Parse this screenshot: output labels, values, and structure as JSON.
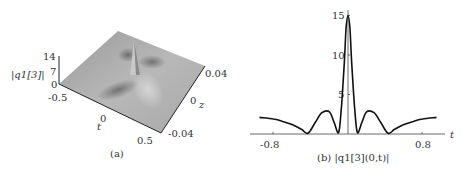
{
  "panels": {
    "a": {
      "caption": "(a)",
      "zlabel": "|q1[3]|",
      "xlabel": "t",
      "ylabel": "z",
      "z_ticks": [
        "0",
        "7",
        "14"
      ],
      "t_ticks": [
        "-0.5",
        "0",
        "0.5"
      ],
      "z_axis_ticks": [
        "-0.04",
        "0",
        "0.04"
      ]
    },
    "b": {
      "caption": "(b) |q1[3](0,t)|",
      "xlabel": "t",
      "x_ticks": [
        "-0.8",
        "0.8"
      ],
      "y_ticks": [
        "5",
        "10",
        "15"
      ]
    }
  },
  "chart_data": [
    {
      "type": "surface",
      "title": "(a)",
      "xlabel": "t",
      "ylabel": "z",
      "zlabel": "|q1[3]|",
      "xlim": [
        -0.5,
        0.5
      ],
      "ylim": [
        -0.04,
        0.04
      ],
      "zlim": [
        0,
        14
      ],
      "x_ticks": [
        -0.5,
        0,
        0.5
      ],
      "y_ticks": [
        -0.04,
        0,
        0.04
      ],
      "z_ticks": [
        0,
        7,
        14
      ],
      "description": "Grey 3D surface of a rogue-wave-like structure: flat background near ~2 with a sharp central peak (~14) at t=0,z=0 flanked by dark troughs along diagonal ridges",
      "peak": {
        "t": 0,
        "z": 0,
        "value": 14
      }
    },
    {
      "type": "line",
      "title": "(b) |q1[3](0,t)|",
      "xlabel": "t",
      "ylabel": "",
      "xlim": [
        -0.95,
        0.95
      ],
      "ylim": [
        0,
        15.5
      ],
      "x_ticks": [
        -0.8,
        0.8
      ],
      "y_ticks": [
        5,
        10,
        15
      ],
      "grid": false,
      "series": [
        {
          "name": "|q1[3](0,t)|",
          "x": [
            -0.95,
            -0.8,
            -0.7,
            -0.6,
            -0.5,
            -0.43,
            -0.35,
            -0.28,
            -0.2,
            -0.15,
            -0.1,
            -0.07,
            -0.04,
            -0.02,
            0,
            0.02,
            0.04,
            0.07,
            0.1,
            0.15,
            0.2,
            0.28,
            0.35,
            0.43,
            0.5,
            0.6,
            0.7,
            0.8,
            0.95
          ],
          "values": [
            2.1,
            1.9,
            1.6,
            1.2,
            0.6,
            0.1,
            1.5,
            2.7,
            2.8,
            1.5,
            0.2,
            3.5,
            9.0,
            13.5,
            15.0,
            13.5,
            9.0,
            3.5,
            0.2,
            1.5,
            2.8,
            2.7,
            1.5,
            0.1,
            0.6,
            1.2,
            1.6,
            1.9,
            2.1
          ]
        }
      ]
    }
  ]
}
